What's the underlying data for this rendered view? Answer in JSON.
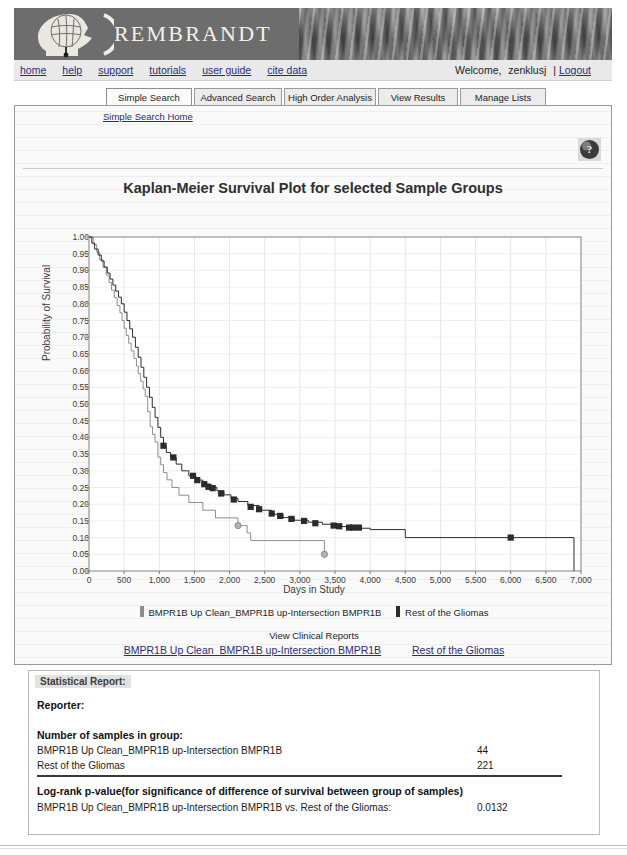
{
  "site": {
    "brand": "REMBRANDT",
    "logo_icon": "head-profile-brain-icon"
  },
  "utility_nav": {
    "links": [
      "home",
      "help",
      "support",
      "tutorials",
      "user guide",
      "cite data"
    ],
    "welcome_label": "Welcome,",
    "username": "zenklusj",
    "separator": "|",
    "logout_label": "Logout"
  },
  "tabs": [
    {
      "label": "Simple Search",
      "active": true
    },
    {
      "label": "Advanced Search",
      "active": false
    },
    {
      "label": "High Order Analysis",
      "active": false
    },
    {
      "label": "View Results",
      "active": false
    },
    {
      "label": "Manage Lists",
      "active": false
    }
  ],
  "subnav": {
    "home_link": "Simple Search Home"
  },
  "help_icon": "question-mark-globe-icon",
  "reports": {
    "heading": "View Clinical Reports",
    "links": [
      "BMPR1B Up Clean_BMPR1B up-Intersection BMPR1B",
      "Rest of the Gliomas"
    ]
  },
  "statistical_report": {
    "header": "Statistical Report:",
    "reporter_label": "Reporter:",
    "reporter_value": "",
    "samples_heading": "Number of samples in group:",
    "sample_rows": [
      {
        "group": "BMPR1B Up Clean_BMPR1B up-Intersection BMPR1B",
        "count": "44"
      },
      {
        "group": "Rest of the Gliomas",
        "count": "221"
      }
    ],
    "pvalue_heading": "Log-rank p-value(for significance of difference of survival between group of samples)",
    "pvalue_row": {
      "label": "BMPR1B Up Clean_BMPR1B up-Intersection BMPR1B vs. Rest of the Gliomas:",
      "value": "0.0132"
    }
  },
  "chart_data": {
    "type": "line",
    "title": "Kaplan-Meier Survival Plot for selected Sample Groups",
    "xlabel": "Days in Study",
    "ylabel": "Probability of Survival",
    "xlim": [
      0,
      7000
    ],
    "ylim": [
      0,
      1.0
    ],
    "xticks": [
      0,
      500,
      1000,
      1500,
      2000,
      2500,
      3000,
      3500,
      4000,
      4500,
      5000,
      5500,
      6000,
      6500,
      7000
    ],
    "xtick_labels": [
      "0",
      "500",
      "1,000",
      "1,500",
      "2,000",
      "2,500",
      "3,000",
      "3,500",
      "4,000",
      "4,500",
      "5,000",
      "5,500",
      "6,000",
      "6,500",
      "7,000"
    ],
    "yticks": [
      0.0,
      0.05,
      0.1,
      0.15,
      0.2,
      0.25,
      0.3,
      0.35,
      0.4,
      0.45,
      0.5,
      0.55,
      0.6,
      0.65,
      0.7,
      0.75,
      0.8,
      0.85,
      0.9,
      0.95,
      1.0
    ],
    "ytick_labels": [
      "0.00",
      "0.05",
      "0.10",
      "0.15",
      "0.20",
      "0.25",
      "0.30",
      "0.35",
      "0.40",
      "0.45",
      "0.50",
      "0.55",
      "0.60",
      "0.65",
      "0.70",
      "0.75",
      "0.80",
      "0.85",
      "0.90",
      "0.95",
      "1.00"
    ],
    "grid": true,
    "legend_position": "below-plot",
    "colors": {
      "series1": "#8d8d8d",
      "series2": "#2b2b2b"
    },
    "series": [
      {
        "name": "BMPR1B Up Clean_BMPR1B up-Intersection BMPR1B",
        "color": "#8d8d8d",
        "marker": "circle",
        "n": 44,
        "points": [
          [
            0,
            1.0
          ],
          [
            60,
            0.977
          ],
          [
            110,
            0.955
          ],
          [
            150,
            0.932
          ],
          [
            200,
            0.909
          ],
          [
            245,
            0.886
          ],
          [
            285,
            0.864
          ],
          [
            320,
            0.841
          ],
          [
            360,
            0.818
          ],
          [
            400,
            0.795
          ],
          [
            440,
            0.773
          ],
          [
            470,
            0.75
          ],
          [
            500,
            0.727
          ],
          [
            530,
            0.705
          ],
          [
            565,
            0.682
          ],
          [
            600,
            0.659
          ],
          [
            640,
            0.636
          ],
          [
            675,
            0.614
          ],
          [
            700,
            0.591
          ],
          [
            735,
            0.568
          ],
          [
            770,
            0.545
          ],
          [
            800,
            0.523
          ],
          [
            835,
            0.477
          ],
          [
            870,
            0.432
          ],
          [
            905,
            0.409
          ],
          [
            940,
            0.386
          ],
          [
            980,
            0.341
          ],
          [
            1020,
            0.318
          ],
          [
            1060,
            0.295
          ],
          [
            1110,
            0.273
          ],
          [
            1180,
            0.25
          ],
          [
            1280,
            0.227
          ],
          [
            1420,
            0.205
          ],
          [
            1620,
            0.182
          ],
          [
            1800,
            0.159
          ],
          [
            2120,
            0.136
          ],
          [
            2250,
            0.114
          ],
          [
            2300,
            0.091
          ],
          [
            3350,
            0.05
          ]
        ],
        "censored": [
          [
            2120,
            0.136
          ],
          [
            3350,
            0.05
          ]
        ]
      },
      {
        "name": "Rest of the Gliomas",
        "color": "#2b2b2b",
        "marker": "square",
        "n": 221,
        "points": [
          [
            0,
            1.0
          ],
          [
            40,
            0.982
          ],
          [
            80,
            0.964
          ],
          [
            130,
            0.946
          ],
          [
            175,
            0.928
          ],
          [
            215,
            0.91
          ],
          [
            260,
            0.892
          ],
          [
            300,
            0.874
          ],
          [
            340,
            0.856
          ],
          [
            380,
            0.838
          ],
          [
            420,
            0.82
          ],
          [
            460,
            0.8
          ],
          [
            500,
            0.775
          ],
          [
            540,
            0.75
          ],
          [
            580,
            0.725
          ],
          [
            620,
            0.7
          ],
          [
            660,
            0.67
          ],
          [
            700,
            0.64
          ],
          [
            740,
            0.61
          ],
          [
            780,
            0.58
          ],
          [
            820,
            0.55
          ],
          [
            860,
            0.52
          ],
          [
            900,
            0.49
          ],
          [
            940,
            0.46
          ],
          [
            980,
            0.43
          ],
          [
            1020,
            0.4
          ],
          [
            1060,
            0.375
          ],
          [
            1100,
            0.355
          ],
          [
            1160,
            0.34
          ],
          [
            1240,
            0.32
          ],
          [
            1320,
            0.3
          ],
          [
            1420,
            0.285
          ],
          [
            1520,
            0.272
          ],
          [
            1620,
            0.26
          ],
          [
            1720,
            0.25
          ],
          [
            1820,
            0.24
          ],
          [
            1920,
            0.228
          ],
          [
            2020,
            0.218
          ],
          [
            2120,
            0.208
          ],
          [
            2260,
            0.196
          ],
          [
            2420,
            0.182
          ],
          [
            2600,
            0.17
          ],
          [
            2760,
            0.16
          ],
          [
            2920,
            0.152
          ],
          [
            3120,
            0.146
          ],
          [
            3320,
            0.14
          ],
          [
            3520,
            0.133
          ],
          [
            3750,
            0.128
          ],
          [
            4000,
            0.124
          ],
          [
            4450,
            0.124
          ],
          [
            4500,
            0.1
          ],
          [
            6900,
            0.1
          ],
          [
            6900,
            0.0
          ]
        ],
        "censored": [
          [
            1060,
            0.375
          ],
          [
            1200,
            0.34
          ],
          [
            1480,
            0.285
          ],
          [
            1540,
            0.272
          ],
          [
            1640,
            0.26
          ],
          [
            1700,
            0.252
          ],
          [
            1760,
            0.248
          ],
          [
            1880,
            0.232
          ],
          [
            2060,
            0.214
          ],
          [
            2300,
            0.192
          ],
          [
            2420,
            0.185
          ],
          [
            2600,
            0.172
          ],
          [
            2720,
            0.165
          ],
          [
            2880,
            0.156
          ],
          [
            3060,
            0.15
          ],
          [
            3220,
            0.143
          ],
          [
            3480,
            0.136
          ],
          [
            3560,
            0.134
          ],
          [
            3700,
            0.13
          ],
          [
            3760,
            0.13
          ],
          [
            3840,
            0.13
          ],
          [
            6000,
            0.1
          ]
        ]
      }
    ]
  }
}
